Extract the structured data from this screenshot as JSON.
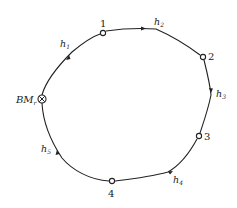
{
  "diagram": {
    "type": "closed-leveling-route",
    "direction": "clockwise",
    "benchmark": {
      "label": "BM",
      "subscript": "r",
      "x": 42,
      "y": 99
    },
    "stations": [
      {
        "id": "1",
        "label": "1",
        "x": 103,
        "y": 33,
        "label_x": 100,
        "label_y": 27
      },
      {
        "id": "2",
        "label": "2",
        "x": 203,
        "y": 57,
        "label_x": 208,
        "label_y": 60
      },
      {
        "id": "3",
        "label": "3",
        "x": 199,
        "y": 136,
        "label_x": 204,
        "label_y": 140
      },
      {
        "id": "4",
        "label": "4",
        "x": 112,
        "y": 181,
        "label_x": 108,
        "label_y": 197
      }
    ],
    "segments": [
      {
        "label": "h",
        "subscript": "1",
        "from": "BM",
        "to": "1",
        "label_x": 60,
        "label_y": 47
      },
      {
        "label": "h",
        "subscript": "2",
        "from": "1",
        "to": "2",
        "label_x": 154,
        "label_y": 25
      },
      {
        "label": "h",
        "subscript": "3",
        "from": "2",
        "to": "3",
        "label_x": 216,
        "label_y": 97
      },
      {
        "label": "h",
        "subscript": "4",
        "from": "3",
        "to": "4",
        "label_x": 173,
        "label_y": 183
      },
      {
        "label": "h",
        "subscript": "5",
        "from": "4",
        "to": "BM",
        "label_x": 41,
        "label_y": 152
      }
    ]
  }
}
